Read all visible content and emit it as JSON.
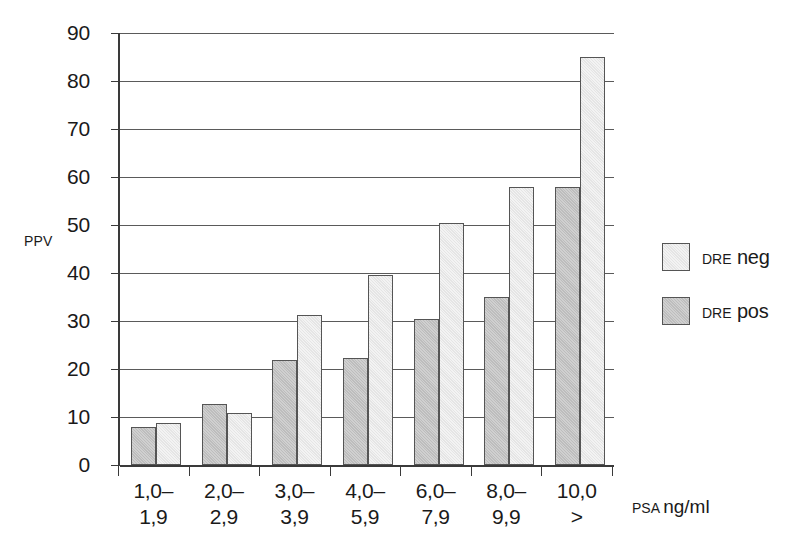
{
  "chart_data": {
    "type": "bar",
    "title": "",
    "subtitle": "",
    "xlabel_prefix": "PSA",
    "xlabel_unit": "ng/ml",
    "ylabel": "PPV",
    "ylim": [
      0,
      90
    ],
    "ytick_step": 10,
    "yticks": [
      0,
      10,
      20,
      30,
      40,
      50,
      60,
      70,
      80,
      90
    ],
    "ytick_labels": [
      "0",
      "10",
      "20",
      "30",
      "40",
      "50",
      "60",
      "70",
      "80",
      "90"
    ],
    "grid": true,
    "grid_axis": "y",
    "legend_position": "right",
    "categories": [
      "1,0–\n1,9",
      "2,0–\n2,9",
      "3,0–\n3,9",
      "4,0–\n5,9",
      "6,0–\n7,9",
      "8,0–\n9,9",
      "10,0\n>"
    ],
    "category_lines": [
      [
        "1,0–",
        "1,9"
      ],
      [
        "2,0–",
        "2,9"
      ],
      [
        "3,0–",
        "3,9"
      ],
      [
        "4,0–",
        "5,9"
      ],
      [
        "6,0–",
        "7,9"
      ],
      [
        "8,0–",
        "9,9"
      ],
      [
        "10,0",
        ">"
      ]
    ],
    "series": [
      {
        "name": "DRE pos",
        "key": "pos",
        "color": "#c4c4c4",
        "legend_prefix": "DRE",
        "legend_value": "pos",
        "values": [
          7.9,
          12.8,
          21.9,
          22.3,
          30.5,
          35.0,
          58.0
        ]
      },
      {
        "name": "DRE neg",
        "key": "neg",
        "color": "#ececec",
        "legend_prefix": "DRE",
        "legend_value": "neg",
        "values": [
          8.8,
          10.8,
          31.3,
          39.5,
          50.5,
          58.0,
          85.0
        ]
      }
    ],
    "series_draw_order": [
      "pos",
      "neg"
    ]
  },
  "legend": {
    "items": [
      {
        "prefix": "DRE",
        "value": "neg",
        "key": "neg"
      },
      {
        "prefix": "DRE",
        "value": "pos",
        "key": "pos"
      }
    ]
  },
  "axes": {
    "y_title": "PPV",
    "x_title_small": "PSA",
    "x_title_large": "ng/ml"
  }
}
